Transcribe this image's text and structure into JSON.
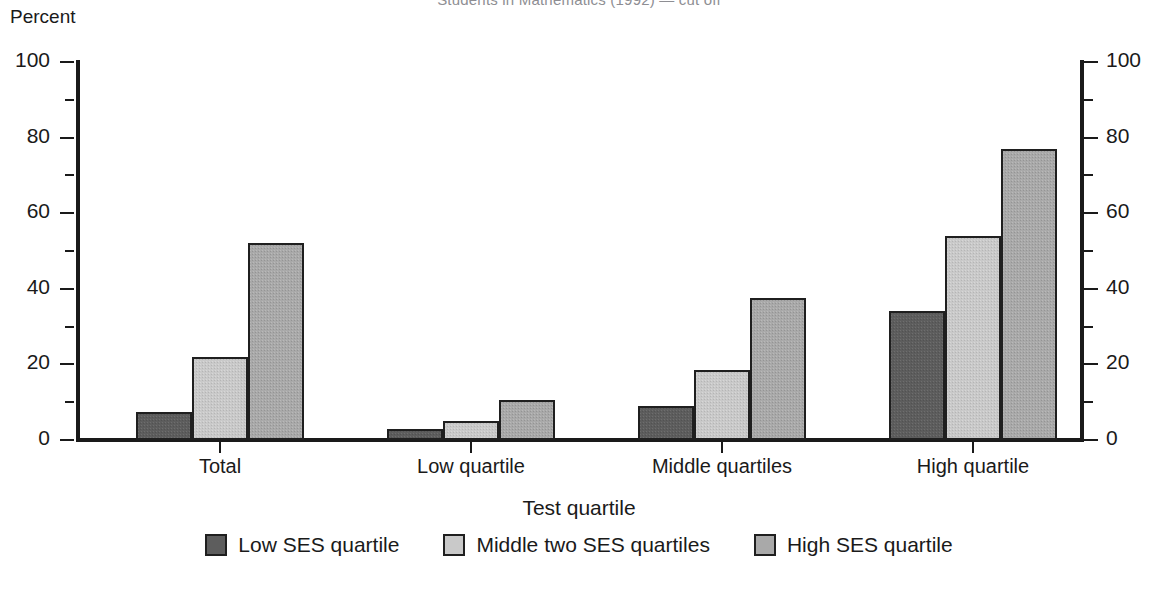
{
  "chart_data": {
    "type": "bar",
    "title": "",
    "xlabel": "Test quartile",
    "ylabel": "Percent",
    "ylim": [
      0,
      100
    ],
    "ytick_step": 20,
    "yminor_step": 10,
    "grid": false,
    "legend_position": "bottom",
    "dual_axis": true,
    "categories": [
      "Total",
      "Low quartile",
      "Middle quartiles",
      "High quartile"
    ],
    "ytick_labels": [
      "0",
      "20",
      "40",
      "60",
      "80",
      "100"
    ],
    "ytick_values": [
      0,
      20,
      40,
      60,
      80,
      100
    ],
    "series": [
      {
        "name": "Low SES quartile",
        "shade": "dark",
        "color": "#5d5d5d",
        "values": [
          7.5,
          3.0,
          9.0,
          34.0
        ]
      },
      {
        "name": "Middle two SES quartiles",
        "shade": "light",
        "color": "#c9c9c9",
        "values": [
          22.0,
          5.0,
          18.5,
          54.0
        ]
      },
      {
        "name": "High SES quartile",
        "shade": "medium",
        "color": "#a9a9a9",
        "values": [
          52.0,
          10.5,
          37.5,
          77.0
        ]
      }
    ]
  },
  "axis": {
    "y_title": "Percent",
    "x_title": "Test quartile"
  },
  "clipped_header": {
    "text": "Students in Mathematics (1992) — cut off"
  }
}
